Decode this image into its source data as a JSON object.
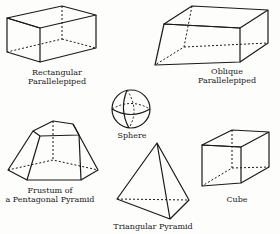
{
  "figure": {
    "shapes": [
      {
        "id": "rectangular-parallelepiped",
        "line1": "Rectangular",
        "line2": "Parallelepiped"
      },
      {
        "id": "oblique-parallelepiped",
        "line1": "Oblique",
        "line2": "Parallelepiped"
      },
      {
        "id": "sphere",
        "line1": "Sphere"
      },
      {
        "id": "frustum",
        "line1": "Frustum of",
        "line2": "a Pentagonal Pyramid"
      },
      {
        "id": "triangular-pyramid",
        "line1": "Triangular Pyramid"
      },
      {
        "id": "cube",
        "line1": "Cube"
      }
    ],
    "colors": {
      "ink": "#1a1a1a",
      "paper": "#fdfdfb"
    }
  }
}
